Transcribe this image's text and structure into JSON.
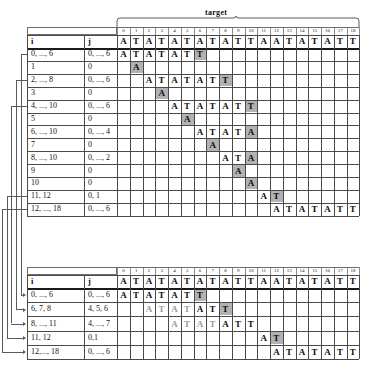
{
  "diagram": {
    "target_label": "target",
    "column_indices": [
      "0",
      "1",
      "2",
      "3",
      "4",
      "5",
      "6",
      "7",
      "8",
      "9",
      "10",
      "11",
      "12",
      "13",
      "14",
      "15",
      "16",
      "17",
      "18"
    ],
    "target_sequence": [
      "A",
      "T",
      "A",
      "T",
      "A",
      "T",
      "A",
      "T",
      "A",
      "T",
      "T",
      "A",
      "A",
      "T",
      "A",
      "T",
      "A",
      "T",
      "T"
    ],
    "headers": {
      "i": "i",
      "j": "j"
    },
    "colors": {
      "highlight": "#b2b2b2",
      "faint_text": "#9a9a9a",
      "text": "#0d0d0d",
      "rule": "#4a4a4a",
      "thick_rule": "#1a1a1a",
      "connector": "#5a5a5a"
    }
  },
  "table1": {
    "rows": [
      {
        "i": "0, ..., 6",
        "j": "0, ..., 6",
        "start": 0,
        "letters": [
          "A",
          "T",
          "A",
          "T",
          "A",
          "T",
          "T"
        ],
        "highlight": [
          6
        ]
      },
      {
        "i": "1",
        "j": "0",
        "start": 1,
        "letters": [
          "A"
        ],
        "highlight": [
          0
        ]
      },
      {
        "i": "2, ..., 8",
        "j": "0, ..., 6",
        "start": 2,
        "letters": [
          "A",
          "T",
          "A",
          "T",
          "A",
          "T",
          "T"
        ],
        "highlight": [
          6
        ]
      },
      {
        "i": "3",
        "j": "0",
        "start": 3,
        "letters": [
          "A"
        ],
        "highlight": [
          0
        ]
      },
      {
        "i": "4, ..., 10",
        "j": "0, ..., 6",
        "start": 4,
        "letters": [
          "A",
          "T",
          "A",
          "T",
          "A",
          "T",
          "T"
        ],
        "highlight": [
          6
        ]
      },
      {
        "i": "5",
        "j": "0",
        "start": 5,
        "letters": [
          "A"
        ],
        "highlight": [
          0
        ]
      },
      {
        "i": "6, ..., 10",
        "j": "0, ..., 4",
        "start": 6,
        "letters": [
          "A",
          "T",
          "A",
          "T",
          "A"
        ],
        "highlight": [
          4
        ]
      },
      {
        "i": "7",
        "j": "0",
        "start": 7,
        "letters": [
          "A"
        ],
        "highlight": [
          0
        ]
      },
      {
        "i": "8, ..., 10",
        "j": "0, ..., 2",
        "start": 8,
        "letters": [
          "A",
          "T",
          "A"
        ],
        "highlight": [
          2
        ]
      },
      {
        "i": "9",
        "j": "0",
        "start": 9,
        "letters": [
          "A"
        ],
        "highlight": [
          0
        ]
      },
      {
        "i": "10",
        "j": "0",
        "start": 10,
        "letters": [
          "A"
        ],
        "highlight": [
          0
        ]
      },
      {
        "i": "11, 12",
        "j": "0, 1",
        "start": 11,
        "letters": [
          "A",
          "T"
        ],
        "highlight": [
          1
        ]
      },
      {
        "i": "12, ..., 18",
        "j": "0, ..., 6",
        "start": 12,
        "letters": [
          "A",
          "T",
          "A",
          "T",
          "A",
          "T",
          "T"
        ],
        "highlight": []
      }
    ]
  },
  "table2": {
    "rows": [
      {
        "i": "0, ..., 6",
        "j": "0, ..., 6",
        "start": 0,
        "letters": [
          "A",
          "T",
          "A",
          "T",
          "A",
          "T",
          "T"
        ],
        "faint": [],
        "highlight": [
          6
        ]
      },
      {
        "i": "6, 7, 8",
        "j": "4, 5, 6",
        "start": 2,
        "letters": [
          "A",
          "T",
          "A",
          "T",
          "A",
          "T",
          "T"
        ],
        "faint": [
          0,
          1,
          2,
          3
        ],
        "highlight": [
          6
        ]
      },
      {
        "i": "8, ..., 11",
        "j": "4, ..., 7",
        "start": 4,
        "letters": [
          "A",
          "T",
          "A",
          "T",
          "A",
          "T",
          "T"
        ],
        "faint": [
          0,
          1,
          2,
          3
        ],
        "highlight": []
      },
      {
        "i": "11, 12",
        "j": "0,1",
        "start": 11,
        "letters": [
          "A",
          "T"
        ],
        "faint": [],
        "highlight": [
          1
        ]
      },
      {
        "i": "12,..., 18",
        "j": "0, ..., 6",
        "start": 12,
        "letters": [
          "A",
          "T",
          "A",
          "T",
          "A",
          "T",
          "T"
        ],
        "faint": [],
        "highlight": []
      }
    ]
  },
  "connectors": [
    {
      "from_row": 0,
      "to_row": 0
    },
    {
      "from_row": 2,
      "to_row": 1
    },
    {
      "from_row": 4,
      "to_row": 2
    },
    {
      "from_row": 11,
      "to_row": 3
    },
    {
      "from_row": 12,
      "to_row": 4
    }
  ]
}
